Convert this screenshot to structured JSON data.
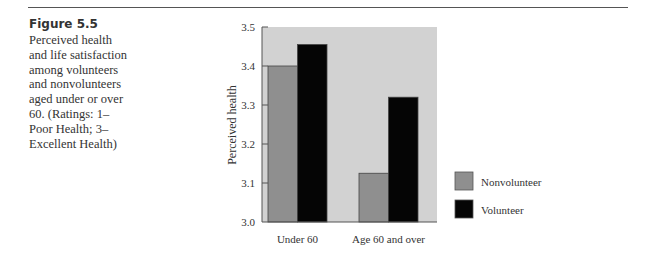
{
  "caption": {
    "figure_label": "Figure 5.5",
    "text": "Perceived health and life satisfaction among volunteers and nonvolunteers aged under or over 60. (Ratings: 1–Poor Health; 3–Excellent Health)"
  },
  "chart_data": {
    "type": "bar",
    "title": "",
    "xlabel": "",
    "ylabel": "Perceived health",
    "categories": [
      "Under 60",
      "Age 60 and over"
    ],
    "series": [
      {
        "name": "Nonvolunteer",
        "color": "#8f8f8f",
        "values": [
          3.4,
          3.125
        ]
      },
      {
        "name": "Volunteer",
        "color": "#050505",
        "values": [
          3.455,
          3.32
        ]
      }
    ],
    "ylim": [
      3.0,
      3.5
    ],
    "yticks": [
      "3.0",
      "3.1",
      "3.2",
      "3.3",
      "3.4",
      "3.5"
    ],
    "plot_background": "#d2d2d2",
    "grid": false,
    "legend_position": "bottom-right"
  }
}
